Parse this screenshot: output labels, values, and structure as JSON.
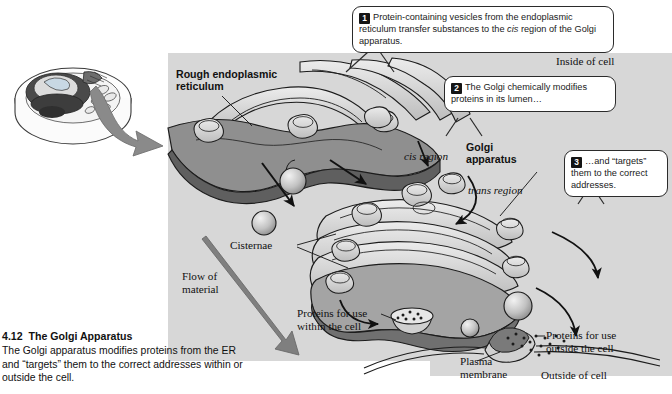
{
  "figure": {
    "number": "4.12",
    "title": "The Golgi Apparatus",
    "caption": "The Golgi apparatus modifies proteins from the ER and “targets” them to the correct addresses within or outside the cell."
  },
  "callouts": [
    {
      "number": "1",
      "text_before": "Protein-containing vesicles from the endoplasmic reticulum transfer substances to the ",
      "italic": "cis",
      "text_after": " region of the Golgi apparatus."
    },
    {
      "number": "2",
      "text_before": "The Golgi chemically modifies proteins in its lumen…",
      "italic": "",
      "text_after": ""
    },
    {
      "number": "3",
      "text_before": "…and “targets” them to the correct addresses.",
      "italic": "",
      "text_after": ""
    }
  ],
  "labels": {
    "rough_er": "Rough endoplasmic\nreticulum",
    "inside_of_cell": "Inside of cell",
    "cis_region": "cis region",
    "golgi_apparatus": "Golgi\napparatus",
    "trans_region": "trans region",
    "cisternae": "Cisternae",
    "flow_of_material": "Flow of\nmaterial",
    "proteins_within": "Proteins for use\nwithin the cell",
    "proteins_outside": "Proteins for use\noutside the cell",
    "plasma_membrane": "Plasma\nmembrane",
    "outside_of_cell": "Outside of cell"
  },
  "colors": {
    "cell_panel": "#d7d7d7",
    "membrane_dark": "#6e6e6e",
    "membrane_mid": "#9a9a9a",
    "membrane_light": "#c9c9c9",
    "lumen_pale": "#e8e8e8",
    "outline": "#1c1c1c",
    "arrow_grey": "#7f7f7f",
    "callout_bg": "#ffffff",
    "badge_bg": "#151515",
    "text": "#111111"
  }
}
